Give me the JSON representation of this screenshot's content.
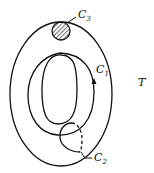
{
  "diagram": {
    "type": "torus-cycles",
    "surface_label": "T",
    "labels": {
      "c1": {
        "letter": "C",
        "sub": "1"
      },
      "c2": {
        "letter": "C",
        "sub": "2"
      },
      "c3": {
        "letter": "C",
        "sub": "3"
      }
    },
    "colors": {
      "stroke": "#111111",
      "background": "#ffffff"
    }
  }
}
